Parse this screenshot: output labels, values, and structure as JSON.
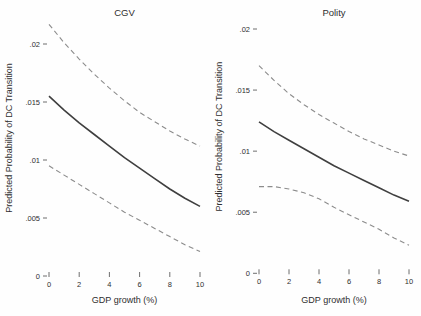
{
  "figure": {
    "background": "#fefefe",
    "text_color": "#2e2e2e",
    "solid_line_color": "#3f3f3f",
    "dashed_line_color": "#8c8c8c"
  },
  "chart_data": [
    {
      "type": "line",
      "title": "CGV",
      "xlabel": "GDP growth (%)",
      "ylabel": "Predicted Probability of DC Transition",
      "xlim": [
        0,
        10
      ],
      "ylim": [
        0,
        0.022
      ],
      "grid": false,
      "legend": "none",
      "xticks": [
        0,
        2,
        4,
        6,
        8,
        10
      ],
      "yticks": [
        0,
        0.005,
        0.01,
        0.015,
        0.02
      ],
      "ytick_labels": [
        "0",
        ".005",
        ".01",
        ".015",
        ".02"
      ],
      "x": [
        0,
        1,
        2,
        3,
        4,
        5,
        6,
        7,
        8,
        9,
        10
      ],
      "series": [
        {
          "name": "upper-confidence-bound",
          "style": "dashed",
          "color": "#8c8c8c",
          "width": 1.1,
          "values": [
            0.0217,
            0.0201,
            0.0187,
            0.0174,
            0.0162,
            0.0151,
            0.0141,
            0.0133,
            0.0125,
            0.0118,
            0.0112
          ]
        },
        {
          "name": "predicted-probability",
          "style": "solid",
          "color": "#3f3f3f",
          "width": 1.6,
          "values": [
            0.0155,
            0.0143,
            0.0132,
            0.0122,
            0.0112,
            0.0102,
            0.0093,
            0.0084,
            0.0075,
            0.0067,
            0.006
          ]
        },
        {
          "name": "lower-confidence-bound",
          "style": "dashed",
          "color": "#8c8c8c",
          "width": 1.1,
          "values": [
            0.0095,
            0.0087,
            0.0079,
            0.0071,
            0.0063,
            0.0055,
            0.0048,
            0.0041,
            0.0034,
            0.0027,
            0.0021
          ]
        }
      ]
    },
    {
      "type": "line",
      "title": "Polity",
      "xlabel": "GDP growth (%)",
      "ylabel": "Predicted Probability of DC Transition",
      "xlim": [
        0,
        10
      ],
      "ylim": [
        0,
        0.0207
      ],
      "grid": false,
      "legend": "none",
      "xticks": [
        0,
        2,
        4,
        6,
        8,
        10
      ],
      "yticks": [
        0,
        0.005,
        0.01,
        0.015,
        0.02
      ],
      "ytick_labels": [
        "0",
        ".005",
        ".01",
        ".015",
        ".02"
      ],
      "x": [
        0,
        1,
        2,
        3,
        4,
        5,
        6,
        7,
        8,
        9,
        10
      ],
      "series": [
        {
          "name": "upper-confidence-bound",
          "style": "dashed",
          "color": "#8c8c8c",
          "width": 1.1,
          "values": [
            0.017,
            0.0158,
            0.0147,
            0.0138,
            0.013,
            0.0123,
            0.0116,
            0.011,
            0.0105,
            0.01,
            0.0096
          ]
        },
        {
          "name": "predicted-probability",
          "style": "solid",
          "color": "#3f3f3f",
          "width": 1.6,
          "values": [
            0.0124,
            0.0116,
            0.0109,
            0.0102,
            0.0095,
            0.0088,
            0.0082,
            0.0076,
            0.007,
            0.0064,
            0.0059
          ]
        },
        {
          "name": "lower-confidence-bound",
          "style": "dashed",
          "color": "#8c8c8c",
          "width": 1.1,
          "values": [
            0.0071,
            0.0071,
            0.0069,
            0.0066,
            0.0061,
            0.0054,
            0.0048,
            0.0042,
            0.0036,
            0.0029,
            0.0023
          ]
        }
      ]
    }
  ]
}
